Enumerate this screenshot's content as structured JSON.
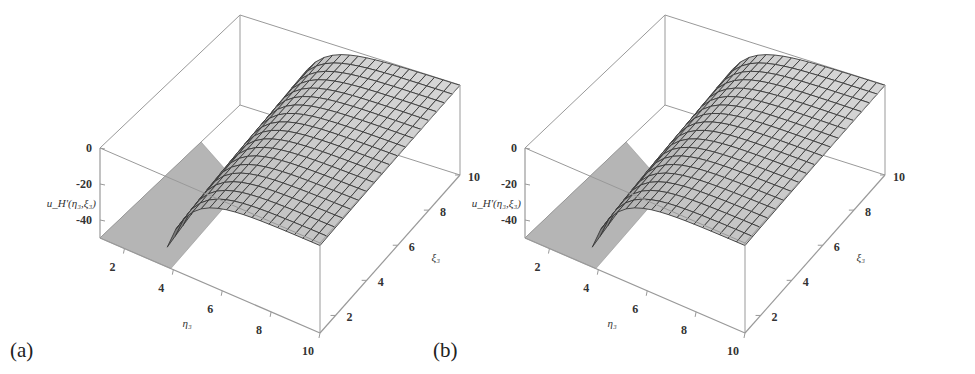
{
  "figure": {
    "panels": [
      {
        "id": "a",
        "label": "(a)"
      },
      {
        "id": "b",
        "label": "(b)"
      }
    ]
  },
  "axes": {
    "z_label": "u_H'(η₃,ξ₃)",
    "x_label": "η₃",
    "y_label": "ξ₃",
    "z_ticks": [
      "0",
      "-20",
      "-40"
    ],
    "x_ticks": [
      "2",
      "4",
      "6",
      "8",
      "10"
    ],
    "y_ticks": [
      "2",
      "4",
      "6",
      "8",
      "10"
    ]
  },
  "colors": {
    "surface_light": "#d8d8d8",
    "surface_dark": "#5a5a5a",
    "mesh": "#3a3a3a",
    "box": "#999999",
    "floor_patch": "#b5b5b5"
  },
  "chart_data": [
    {
      "type": "surface3d",
      "panel": "(a)",
      "title": "",
      "xlabel": "η₃",
      "ylabel": "ξ₃",
      "zlabel": "u_H'(η₃,ξ₃)",
      "xlim": [
        1,
        10
      ],
      "ylim": [
        1,
        10
      ],
      "zlim": [
        -50,
        0
      ],
      "x_ticks": [
        2,
        4,
        6,
        8,
        10
      ],
      "y_ticks": [
        2,
        4,
        6,
        8,
        10
      ],
      "z_ticks": [
        0,
        -20,
        -40
      ],
      "mesh_lines": "approx 18x18",
      "description": "Surface rises steeply from about -50 near small η₃ (~4) and small ξ₃ to a plateau near 0 for large η₃ and ξ₃; a flat grey floor region is visible for η₃ < ~4."
    },
    {
      "type": "surface3d",
      "panel": "(b)",
      "title": "",
      "xlabel": "η₃",
      "ylabel": "ξ₃",
      "zlabel": "u_H'(η₃,ξ₃)",
      "xlim": [
        1,
        10
      ],
      "ylim": [
        1,
        10
      ],
      "zlim": [
        -50,
        0
      ],
      "x_ticks": [
        2,
        4,
        6,
        8,
        10
      ],
      "y_ticks": [
        2,
        4,
        6,
        8,
        10
      ],
      "z_ticks": [
        0,
        -20,
        -40
      ],
      "mesh_lines": "approx 18x18",
      "description": "Nearly identical surface to panel (a): steep rise from ~-50 near η₃≈4, small ξ₃ to a plateau near 0."
    }
  ]
}
